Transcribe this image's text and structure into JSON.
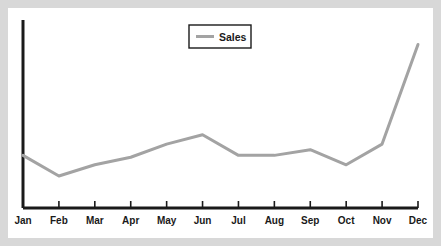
{
  "chart_data": {
    "type": "line",
    "title": "",
    "xlabel": "",
    "ylabel": "",
    "categories": [
      "Jan",
      "Feb",
      "Mar",
      "Apr",
      "May",
      "Jun",
      "Jul",
      "Aug",
      "Sep",
      "Oct",
      "Nov",
      "Dec"
    ],
    "series": [
      {
        "name": "Sales",
        "color": "#a3a3a3",
        "values": [
          28,
          17,
          23,
          27,
          34,
          39,
          28,
          28,
          31,
          23,
          34,
          87
        ]
      }
    ],
    "ylim": [
      0,
      100
    ],
    "grid": false,
    "legend": {
      "position": "top-center",
      "entries": [
        "Sales"
      ]
    },
    "axis_color": "#1a1a1a",
    "background_color": "#ffffff",
    "page_background_color": "#d8d8d8"
  },
  "legend": {
    "sales_label": "Sales"
  }
}
